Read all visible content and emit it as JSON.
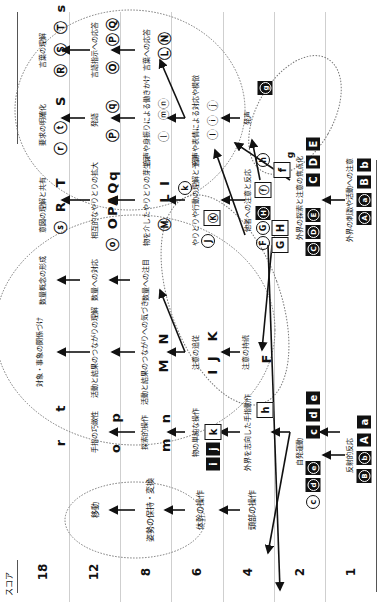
{
  "axis": {
    "title": "スコア",
    "scores": [
      "18",
      "12",
      "8",
      "6",
      "4",
      "2",
      "1"
    ]
  },
  "columns_score_map": {
    "18": "col 1",
    "12": "col 2",
    "8": "col 3",
    "6": "col 4",
    "4": "col 5",
    "2": "col 6",
    "1": "col 7"
  },
  "motor_cluster": {
    "items": [
      "移動",
      "姿勢の保持・変換",
      "体幹の操作",
      "頭部の操作"
    ]
  },
  "hand_cluster": {
    "row18": [
      "r",
      "t"
    ],
    "row12": [
      "o",
      "p"
    ],
    "row12_label": "手指の巧緻性",
    "row8": [
      "m",
      "n"
    ],
    "row8_label": "探索的操作",
    "row6": [
      "i",
      "j",
      "k"
    ],
    "row6_label": "物の単純な操作",
    "row4": [
      "h"
    ],
    "row4_label": "外界を志向した手指動作"
  },
  "cognition_cluster": {
    "row18_label": "対象・事象の関係づけ",
    "row12_label": "活動と結果のつながりの理解",
    "row8_label": "活動と結果のつながりへの気づき",
    "row8_syms": [
      "M",
      "N"
    ],
    "row6_label": "注意の追従",
    "row6_syms": [
      "I",
      "J",
      "K"
    ],
    "row4_label": "注意の持続",
    "row4_sym": "F"
  },
  "number_cluster": {
    "row18": "数量概念の形成",
    "row12": "数量への対応",
    "row8": "数量への注目"
  },
  "communication_cluster": {
    "row18_syms": [
      "s",
      "R",
      "T"
    ],
    "row18_label": "意図の理解と共有",
    "row12_syms": [
      "o",
      "O",
      "P",
      "A",
      "Q",
      "q"
    ],
    "row12_label": "相互的なやりとりの拡大",
    "row8_syms": [
      "M",
      "L",
      "I"
    ],
    "row8_label": "物を介したやりとりの芽生え",
    "row6_syms": [
      "J",
      "K",
      "k"
    ],
    "row6_label": "やりとりや行動の理解と予測",
    "row4_label": "他者への注意と反応",
    "row4_syms": [
      "F",
      "G",
      "H",
      "f",
      "h",
      "G",
      "H"
    ]
  },
  "language_cluster": {
    "row18_syms": [
      "r",
      "t",
      "S"
    ],
    "row18_label": "要求の明確化",
    "row12_syms": [
      "P",
      "q"
    ],
    "row12_label": "発語",
    "row8_syms": [
      "l",
      "m",
      "n"
    ],
    "row8_label": "音声や身振りによる働きかけ",
    "row6_syms": [
      "I",
      "i",
      "j"
    ],
    "row6_label": "音声や表情による対応や模倣",
    "row4_syms": [
      "g"
    ],
    "row4_label": "発声",
    "row4_extra": "g"
  },
  "verbal_cluster": {
    "row18_syms": [
      "R",
      "S",
      "T",
      "s"
    ],
    "row18_label": "言葉の理解",
    "row12_syms": [
      "O",
      "P",
      "Q"
    ],
    "row12_label": "言語指示への応答",
    "row8_syms": [
      "L",
      "N"
    ],
    "row8_label": "言葉への応答"
  },
  "sensory_cluster": {
    "row2_syms": [
      "C",
      "D",
      "E",
      "C",
      "D",
      "E"
    ],
    "row2_label": "外界の探索と注意の焦点化",
    "row1_syms": [
      "A",
      "a",
      "B",
      "b"
    ],
    "row1_label": "外界の刺激や活動への注意"
  },
  "spontaneous_cluster": {
    "row2_syms": [
      "c",
      "d",
      "e",
      "c",
      "d",
      "e"
    ],
    "row2_label": "自発運動",
    "row1_syms": [
      "B",
      "b",
      "A",
      "a"
    ],
    "row1_label": "反射的反応"
  }
}
